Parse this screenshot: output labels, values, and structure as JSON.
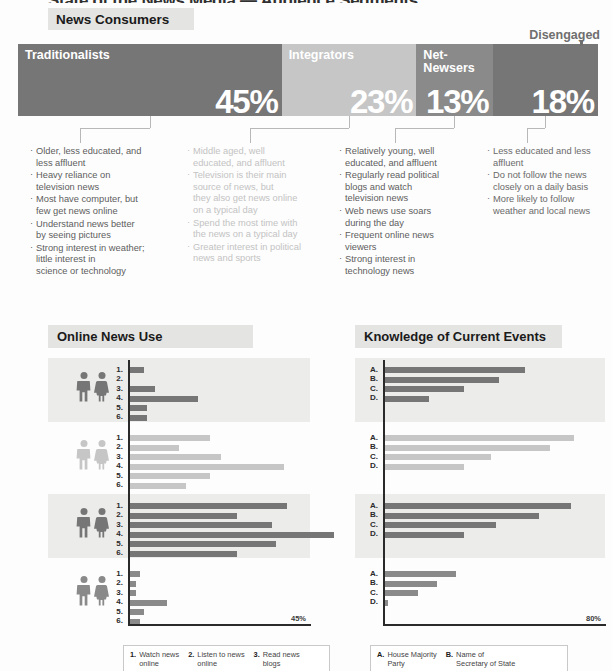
{
  "headline": "State of the News Media  —  Audience Segments",
  "sections": {
    "news_consumers_title": "News Consumers",
    "online_news_title": "Online News Use",
    "knowledge_title": "Knowledge of Current Events"
  },
  "disengaged_label": "Disengaged",
  "colors": {
    "traditionalists": "#767676",
    "integrators": "#c6c6c6",
    "net_newsers": "#8a8a8a",
    "disengaged": "#767676",
    "text_dark": "#5d5d5d",
    "text_light": "#c3c3c3",
    "axis": "#2a2a2a",
    "band": "#ececea"
  },
  "segments": [
    {
      "name": "Traditionalists",
      "percent": "45%",
      "value": 45,
      "color": "#767676",
      "text_color": "#5d5d5d",
      "bullets": [
        "Older, less educated, and\nless affluent",
        "Heavy reliance on\ntelevision news",
        "Most have computer, but\nfew get news online",
        "Understand news better\nby seeing pictures",
        "Strong interest in weather;\nlittle interest in\nscience or technology"
      ]
    },
    {
      "name": "Integrators",
      "percent": "23%",
      "value": 23,
      "color": "#c6c6c6",
      "text_color": "#c3c3c3",
      "bullets": [
        "Middle aged, well\neducated, and affluent",
        "Television is their main\nsource of news, but\nthey also get news online\non a typical day",
        "Spend the most time with\nthe news on a typical day",
        "Greater interest in political\nnews and sports"
      ]
    },
    {
      "name": "Net-\nNewsers",
      "percent": "13%",
      "value": 13,
      "color": "#8a8a8a",
      "text_color": "#5d5d5d",
      "bullets": [
        "Relatively young, well\neducated, and affluent",
        "Regularly read political\nblogs and watch\ntelevision news",
        "Web news use soars\nduring the day",
        "Frequent online news\nviewers",
        "Strong interest in\ntechnology news"
      ]
    },
    {
      "name": "",
      "percent": "18%",
      "value": 18,
      "color": "#767676",
      "text_color": "#6a6a6a",
      "bullets": [
        "Less educated and less\naffluent",
        "Do not follow the news\nclosely on a daily basis",
        "More likely to follow\nweather and local news"
      ]
    }
  ],
  "chart_data": [
    {
      "type": "bar",
      "title": "Online News Use",
      "orientation": "horizontal",
      "categories": [
        "1.",
        "2.",
        "3.",
        "4.",
        "5.",
        "6."
      ],
      "xlabel": "",
      "ylabel": "",
      "xlim": [
        0,
        45
      ],
      "axis_max_label": "45%",
      "grid": false,
      "legend_position": "bottom",
      "legend": [
        {
          "key": "1.",
          "text": "Watch news\nonline"
        },
        {
          "key": "2.",
          "text": "Listen to news\nonline"
        },
        {
          "key": "3.",
          "text": "Read news\nblogs"
        }
      ],
      "series": [
        {
          "name": "Traditionalists",
          "color": "#767676",
          "shaded_band": true,
          "values": [
            4,
            0,
            7,
            18,
            5,
            5
          ]
        },
        {
          "name": "Integrators",
          "color": "#c6c6c6",
          "shaded_band": false,
          "values": [
            21,
            13,
            24,
            40,
            21,
            15
          ]
        },
        {
          "name": "Net-Newsers",
          "color": "#767676",
          "shaded_band": true,
          "values": [
            41,
            28,
            37,
            53,
            38,
            28
          ]
        },
        {
          "name": "Disengaged",
          "color": "#8a8a8a",
          "shaded_band": false,
          "values": [
            3,
            2,
            2,
            10,
            4,
            3
          ]
        }
      ]
    },
    {
      "type": "bar",
      "title": "Knowledge of Current Events",
      "orientation": "horizontal",
      "categories": [
        "A.",
        "B.",
        "C.",
        "D."
      ],
      "xlabel": "",
      "ylabel": "",
      "xlim": [
        0,
        80
      ],
      "axis_max_label": "80%",
      "grid": false,
      "legend_position": "bottom",
      "legend": [
        {
          "key": "A.",
          "text": "House Majority\nParty"
        },
        {
          "key": "B.",
          "text": "Name of\nSecretary of State"
        }
      ],
      "series": [
        {
          "name": "Traditionalists",
          "color": "#767676",
          "shaded_band": true,
          "values": [
            53,
            43,
            30,
            17
          ]
        },
        {
          "name": "Integrators",
          "color": "#c6c6c6",
          "shaded_band": false,
          "values": [
            71,
            62,
            40,
            30
          ]
        },
        {
          "name": "Net-Newsers",
          "color": "#767676",
          "shaded_band": true,
          "values": [
            70,
            58,
            42,
            30
          ]
        },
        {
          "name": "Disengaged",
          "color": "#8a8a8a",
          "shaded_band": false,
          "values": [
            27,
            20,
            13,
            2
          ]
        }
      ]
    }
  ]
}
